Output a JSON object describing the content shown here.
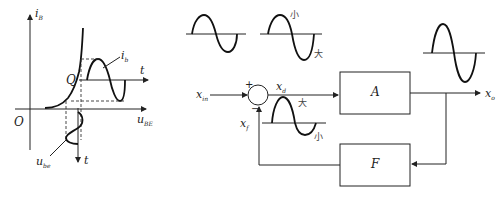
{
  "left_graph": {
    "y_axis_label": "i",
    "y_axis_sub": "B",
    "x_axis_label": "u",
    "x_axis_sub": "BE",
    "origin_label": "O",
    "q_point_label": "Q",
    "ib_wave_label": "i",
    "ib_wave_sub": "b",
    "ube_wave_label": "u",
    "ube_wave_sub": "be",
    "time_axis_right": "t",
    "time_axis_down": "t"
  },
  "block_diagram": {
    "input_label": "x",
    "input_sub": "in",
    "diff_label": "x",
    "diff_sub": "d",
    "feedback_label": "x",
    "feedback_sub": "f",
    "output_label": "x",
    "output_sub": "o",
    "plus_sign": "+",
    "minus_sign": "−",
    "amplifier_block": "A",
    "feedback_block": "F",
    "wave2_top_note": "小",
    "wave2_bottom_note": "大",
    "feedback_wave_top_note": "大",
    "feedback_wave_bottom_note": "小"
  }
}
